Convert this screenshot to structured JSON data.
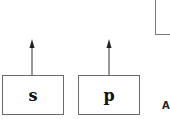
{
  "diagram": {
    "boxes": [
      {
        "id": "s",
        "label": "s"
      },
      {
        "id": "p",
        "label": "p"
      },
      {
        "id": "top-right",
        "label": ""
      }
    ],
    "arrows": [
      {
        "from": "s",
        "direction": "up"
      },
      {
        "from": "p",
        "direction": "up"
      }
    ],
    "partial_label": "A",
    "colors": {
      "stroke": "#6a6a6a",
      "arrow": "#222222",
      "text": "#111111"
    }
  }
}
